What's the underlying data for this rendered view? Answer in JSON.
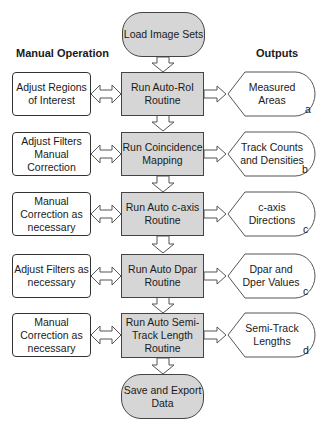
{
  "start": {
    "label": "Load Image Sets"
  },
  "end": {
    "label": "Save and Export Data"
  },
  "headers": {
    "manual": "Manual Operation",
    "outputs": "Outputs"
  },
  "rows": [
    {
      "manual": "Adjust Regions of Interest",
      "process": "Run Auto-RoI Routine",
      "output": "Measured Areas",
      "tag": "a"
    },
    {
      "manual": "Adjust Filters Manual Correction",
      "process": "Run Coincidence Mapping",
      "output": "Track Counts and Densities",
      "tag": "b"
    },
    {
      "manual": "Manual Correction as necessary",
      "process": "Run Auto c-axis Routine",
      "output": "c-axis Directions",
      "tag": "c"
    },
    {
      "manual": "Adjust Filters as necessary",
      "process": "Run Auto Dpar Routine",
      "output": "Dpar and Dper Values",
      "tag": "c"
    },
    {
      "manual": "Manual Correction as necessary",
      "process": "Run Auto Semi-Track Length Routine",
      "output": "Semi-Track Lengths",
      "tag": "d"
    }
  ],
  "colors": {
    "process_fill": "#d6d6d6",
    "stroke": "#444444"
  }
}
